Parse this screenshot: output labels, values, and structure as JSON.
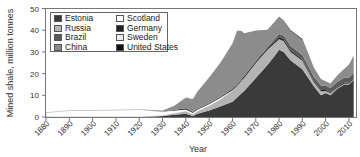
{
  "chart_data": {
    "type": "area",
    "stacked": true,
    "title": "",
    "xlabel": "Year",
    "ylabel": "Mined shale, million tonnes",
    "xlim": [
      1880,
      2012
    ],
    "ylim": [
      0,
      50
    ],
    "x_ticks": [
      "1880",
      "1890",
      "1900",
      "1910",
      "1920",
      "1930",
      "1940",
      "1950",
      "1960",
      "1970",
      "1980",
      "1990",
      "2000",
      "2010"
    ],
    "y_ticks": [
      "0",
      "10",
      "20",
      "30",
      "40",
      "50"
    ],
    "grid": false,
    "legend_position": "upper-left inside",
    "legend": [
      "Estonia",
      "Russia",
      "Brazil",
      "China",
      "Scotland",
      "Germany",
      "Sweden",
      "United States"
    ],
    "x": [
      1880,
      1890,
      1900,
      1910,
      1920,
      1930,
      1935,
      1940,
      1943,
      1945,
      1950,
      1955,
      1960,
      1962,
      1964,
      1965,
      1970,
      1975,
      1978,
      1980,
      1982,
      1985,
      1990,
      1995,
      1998,
      2000,
      2002,
      2005,
      2008,
      2010,
      2012
    ],
    "series": [
      {
        "name": "Estonia",
        "color": "#3a3a3a",
        "values": [
          0,
          0,
          0,
          0,
          0,
          0.5,
          1,
          1.5,
          0.5,
          1.5,
          3,
          5,
          7,
          9,
          11,
          12,
          18,
          24,
          28,
          31,
          30,
          26,
          22,
          14,
          10,
          11,
          10,
          13,
          15,
          15,
          17
        ]
      },
      {
        "name": "Russia",
        "color": "#b4b4b4",
        "values": [
          0,
          0,
          0,
          0,
          0,
          0,
          0.5,
          1,
          0.5,
          1,
          2,
          3,
          5,
          5,
          6,
          6,
          7,
          7,
          6,
          5,
          5,
          4,
          4,
          2,
          2,
          1,
          1,
          0.5,
          0.5,
          0.5,
          0.5
        ]
      },
      {
        "name": "Scotland",
        "color": "#ffffff",
        "values": [
          2,
          3,
          3,
          3.2,
          3.5,
          2,
          1.5,
          1,
          1,
          1,
          1,
          1,
          0.5,
          0.3,
          0,
          0,
          0,
          0,
          0,
          0,
          0,
          0,
          0,
          0,
          0,
          0,
          0,
          0,
          0,
          0,
          0
        ]
      },
      {
        "name": "Germany",
        "color": "#202020",
        "values": [
          0,
          0,
          0,
          0,
          0,
          0,
          0.2,
          0.5,
          0.3,
          0.3,
          0.3,
          0.3,
          0.5,
          0.5,
          0.6,
          0.6,
          0.7,
          0.7,
          0.8,
          0.8,
          0.8,
          0.7,
          0.6,
          0.5,
          0.5,
          0.5,
          0.4,
          0.4,
          0.4,
          0.4,
          0.4
        ]
      },
      {
        "name": "Brazil",
        "color": "#5a5a5a",
        "values": [
          0,
          0,
          0,
          0,
          0,
          0,
          0,
          0,
          0,
          0,
          0,
          0,
          0,
          0,
          0,
          0,
          0.2,
          0.5,
          1,
          1.5,
          1.8,
          2,
          2,
          2,
          2,
          2,
          2,
          2.2,
          2.3,
          2.3,
          2.4
        ]
      },
      {
        "name": "China",
        "color": "#8c8c8c",
        "values": [
          0,
          0,
          0,
          0,
          0,
          0.5,
          2,
          5,
          6,
          8,
          12,
          16,
          21,
          25,
          22,
          20,
          14,
          8,
          8,
          8,
          7,
          7,
          7,
          4,
          3,
          2,
          2,
          3,
          4,
          6,
          8
        ]
      },
      {
        "name": "Sweden",
        "color": "#ececec",
        "values": [
          0,
          0,
          0,
          0,
          0,
          0,
          0.3,
          0.5,
          0.6,
          0.6,
          0.5,
          0.4,
          0.3,
          0.2,
          0.1,
          0,
          0,
          0,
          0,
          0,
          0,
          0,
          0,
          0,
          0,
          0,
          0,
          0,
          0,
          0,
          0
        ]
      },
      {
        "name": "United States",
        "color": "#111111",
        "values": [
          0,
          0,
          0,
          0,
          0,
          0,
          0,
          0,
          0,
          0,
          0,
          0,
          0,
          0,
          0,
          0,
          0,
          0,
          0,
          0,
          0,
          0.3,
          0.3,
          0.1,
          0,
          0,
          0,
          0,
          0,
          0,
          0
        ]
      }
    ]
  },
  "legend_items": [
    {
      "label": "Estonia",
      "color": "#3a3a3a"
    },
    {
      "label": "Scotland",
      "color": "#ffffff"
    },
    {
      "label": "Russia",
      "color": "#b4b4b4"
    },
    {
      "label": "Germany",
      "color": "#202020"
    },
    {
      "label": "Brazil",
      "color": "#5a5a5a"
    },
    {
      "label": "Sweden",
      "color": "#ececec"
    },
    {
      "label": "China",
      "color": "#8c8c8c"
    },
    {
      "label": "United States",
      "color": "#111111"
    }
  ]
}
